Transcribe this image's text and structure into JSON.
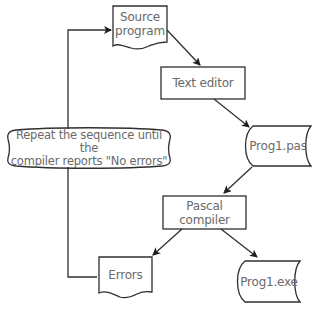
{
  "diagram": {
    "type": "flowchart",
    "colors": {
      "stroke": "#2f2f2f",
      "text": "#6a6a6a",
      "background": "#ffffff"
    },
    "nodes": {
      "source": {
        "shape": "document",
        "line1": "Source",
        "line2": "program"
      },
      "editor": {
        "shape": "process",
        "label": "Text editor"
      },
      "pas": {
        "shape": "stored-data",
        "label": "Prog1.pas"
      },
      "compiler": {
        "shape": "process",
        "line1": "Pascal",
        "line2": "compiler"
      },
      "errors": {
        "shape": "document",
        "label": "Errors"
      },
      "exe": {
        "shape": "stored-data",
        "label": "Prog1.exe"
      },
      "repeat": {
        "shape": "annotation",
        "line1": "Repeat the sequence until the",
        "line2": "compiler reports \"No errors\""
      }
    },
    "edges": [
      {
        "from": "source",
        "to": "editor"
      },
      {
        "from": "editor",
        "to": "pas"
      },
      {
        "from": "pas",
        "to": "compiler"
      },
      {
        "from": "compiler",
        "to": "errors"
      },
      {
        "from": "compiler",
        "to": "exe"
      },
      {
        "from": "errors",
        "to": "source",
        "via": "repeat"
      }
    ]
  }
}
